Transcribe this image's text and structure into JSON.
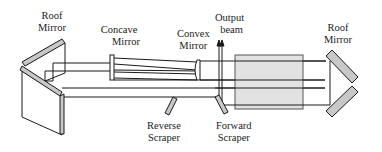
{
  "diagram": {
    "labels": {
      "left_roof_mirror": [
        "Roof",
        "Mirror"
      ],
      "concave_mirror": [
        "Concave",
        "Mirror"
      ],
      "convex_mirror": [
        "Convex",
        "Mirror"
      ],
      "output_beam": [
        "Output",
        "beam"
      ],
      "right_roof_mirror": [
        "Roof",
        "Mirror"
      ],
      "reverse_scraper": [
        "Reverse",
        "Scraper"
      ],
      "forward_scraper": [
        "Forward",
        "Scraper"
      ]
    },
    "colors": {
      "line": "#1a1a1a",
      "mirror_fill": "#c8c8c8",
      "gain_medium_fill": "#e2e2e2",
      "background": "#ffffff"
    }
  }
}
